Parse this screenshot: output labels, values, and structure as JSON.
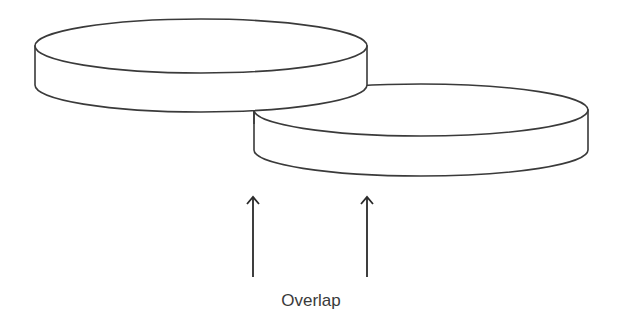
{
  "diagram": {
    "label": "Overlap",
    "colors": {
      "stroke": "#3a3a3a",
      "fill": "#ffffff",
      "text": "#3a3a3a"
    },
    "disks": [
      {
        "name": "upper-left-disk",
        "cx": 201,
        "top_cy": 46,
        "rx": 166,
        "ry": 27,
        "thickness": 39
      },
      {
        "name": "lower-right-disk",
        "cx": 421,
        "top_cy": 110,
        "rx": 167,
        "ry": 26,
        "thickness": 40
      }
    ],
    "arrows": [
      {
        "name": "left-overlap-arrow",
        "x": 253,
        "y_top": 197,
        "y_bottom": 277
      },
      {
        "name": "right-overlap-arrow",
        "x": 367,
        "y_top": 197,
        "y_bottom": 277
      }
    ]
  }
}
